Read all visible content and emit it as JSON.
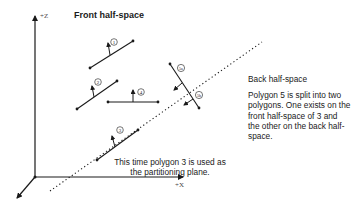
{
  "diagram": {
    "title_front": "Front half-space",
    "title_back": "Back half-space",
    "note_split": "Polygon 5 is split into two polygons.  One exists on the front half-space of 3 and the other on the back half-space.",
    "note_partition": "This time polygon 3 is used as the partitioning plane.",
    "axes": {
      "z": "+Z",
      "x": "+X"
    },
    "polygons": [
      {
        "id": "1",
        "label": "1"
      },
      {
        "id": "2",
        "label": "2"
      },
      {
        "id": "3",
        "label": "3"
      },
      {
        "id": "4",
        "label": "4"
      },
      {
        "id": "5a",
        "label": "5a"
      },
      {
        "id": "5b",
        "label": "5b"
      }
    ],
    "colors": {
      "ink": "#1a1a1a",
      "background": "#ffffff"
    }
  }
}
